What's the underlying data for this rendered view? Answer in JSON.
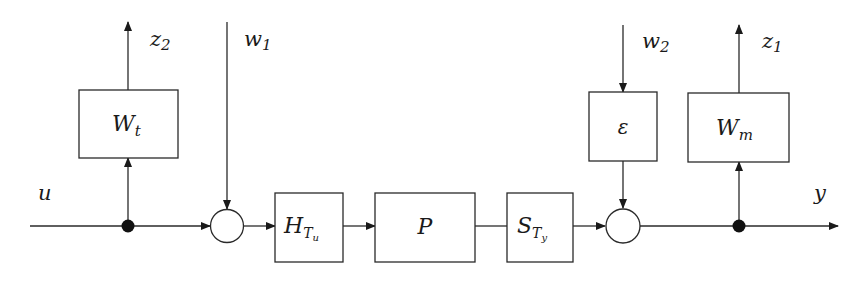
{
  "diagram": {
    "type": "block-diagram",
    "blocks": {
      "Wt": {
        "main": "W",
        "sub": "t"
      },
      "H": {
        "main": "H",
        "sub": "T",
        "subsub": "u"
      },
      "P": {
        "main": "P"
      },
      "S": {
        "main": "S",
        "sub": "T",
        "subsub": "y"
      },
      "eps": {
        "main": "ε"
      },
      "Wm": {
        "main": "W",
        "sub": "m"
      }
    },
    "signals": {
      "u": "u",
      "y": "y",
      "z1": {
        "main": "z",
        "sub": "1"
      },
      "z2": {
        "main": "z",
        "sub": "2"
      },
      "w1": {
        "main": "w",
        "sub": "1"
      },
      "w2": {
        "main": "w",
        "sub": "2"
      }
    },
    "colors": {
      "line": "#2a2a2a",
      "node": "#111111",
      "background": "#ffffff"
    }
  }
}
